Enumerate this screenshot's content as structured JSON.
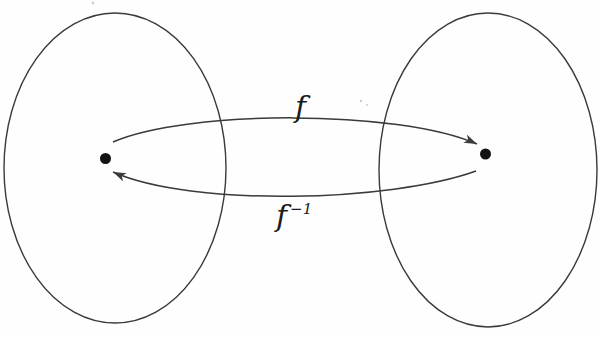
{
  "diagram": {
    "labels": {
      "forward_function": "f",
      "inverse_base": "f",
      "inverse_superscript": "−1"
    },
    "colors": {
      "stroke": "#3a3a3a",
      "dot_fill": "#121212",
      "label_color": "#1c1c1c",
      "background": "#fefefe"
    }
  }
}
